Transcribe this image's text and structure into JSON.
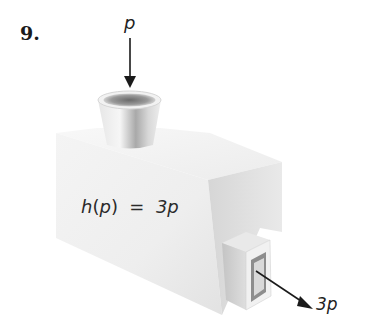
{
  "exercise": {
    "number": "9."
  },
  "machine": {
    "input_label": "p",
    "rule_name": "h",
    "rule_arg": "p",
    "rule_rhs": "3p",
    "rule_text": "h(p) = 3p",
    "output_label": "3p"
  },
  "colors": {
    "background": "#ffffff",
    "box_front": "#ededed",
    "box_side": "#dcdcdc",
    "arrow": "#1a1a1a"
  }
}
